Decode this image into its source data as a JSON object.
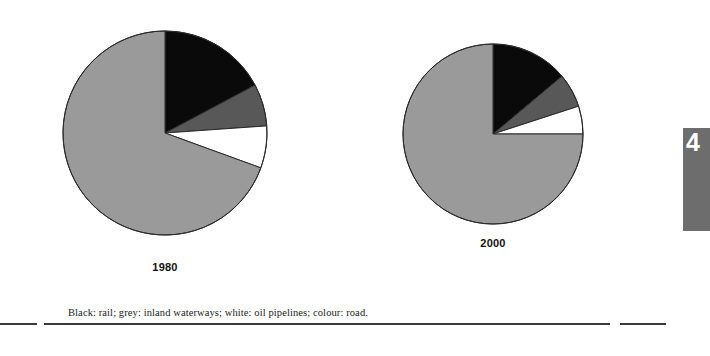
{
  "figure": {
    "legend_note": "Black: rail; grey: inland waterways; white: oil pipelines; colour: road.",
    "side_tab_number": "4"
  },
  "chart_data": [
    {
      "type": "pie",
      "title": "1980",
      "categories": [
        "rail",
        "road",
        "inland waterways",
        "oil pipelines"
      ],
      "labels": [
        "Black: rail",
        "Colour: road",
        "Grey: inland waterways",
        "White: oil pipelines"
      ],
      "values": [
        17.2,
        69.4,
        6.7,
        6.7
      ],
      "colors": [
        "#0a0a0a",
        "#9a9a9a",
        "#585858",
        "#ffffff"
      ],
      "start_angle_deg": 0,
      "direction": "clockwise",
      "segments": [
        {
          "name": "rail",
          "color": "#0a0a0a",
          "start_deg": 0,
          "end_deg": 62,
          "percent": 17.2
        },
        {
          "name": "inland waterways",
          "color": "#585858",
          "start_deg": 62,
          "end_deg": 86,
          "percent": 6.7
        },
        {
          "name": "oil pipelines",
          "color": "#ffffff",
          "start_deg": 86,
          "end_deg": 110,
          "percent": 6.7
        },
        {
          "name": "road",
          "color": "#9a9a9a",
          "start_deg": 110,
          "end_deg": 360,
          "percent": 69.4
        }
      ],
      "legend": "Black: rail; grey: inland waterways; white: oil pipelines; colour: road.",
      "xlabel": "",
      "ylabel": ""
    },
    {
      "type": "pie",
      "title": "2000",
      "categories": [
        "rail",
        "road",
        "inland waterways",
        "oil pipelines"
      ],
      "labels": [
        "Black: rail",
        "Colour: road",
        "Grey: inland waterways",
        "White: oil pipelines"
      ],
      "values": [
        13.9,
        75.0,
        6.1,
        5.0
      ],
      "colors": [
        "#0a0a0a",
        "#9a9a9a",
        "#585858",
        "#ffffff"
      ],
      "start_angle_deg": 0,
      "direction": "clockwise",
      "segments": [
        {
          "name": "rail",
          "color": "#0a0a0a",
          "start_deg": 0,
          "end_deg": 50,
          "percent": 13.9
        },
        {
          "name": "inland waterways",
          "color": "#585858",
          "start_deg": 50,
          "end_deg": 72,
          "percent": 6.1
        },
        {
          "name": "oil pipelines",
          "color": "#ffffff",
          "start_deg": 72,
          "end_deg": 90,
          "percent": 5.0
        },
        {
          "name": "road",
          "color": "#9a9a9a",
          "start_deg": 90,
          "end_deg": 360,
          "percent": 75.0
        }
      ],
      "legend": "Black: rail; grey: inland waterways; white: oil pipelines; colour: road.",
      "xlabel": "",
      "ylabel": ""
    }
  ],
  "colors": {
    "rail_black": "#0a0a0a",
    "road_grey": "#9a9a9a",
    "waterways_darkgrey": "#585858",
    "pipelines_white": "#ffffff",
    "outline": "#2b2b2b",
    "rule": "#3a3a3a",
    "side_tab": "#6d6d6d"
  }
}
